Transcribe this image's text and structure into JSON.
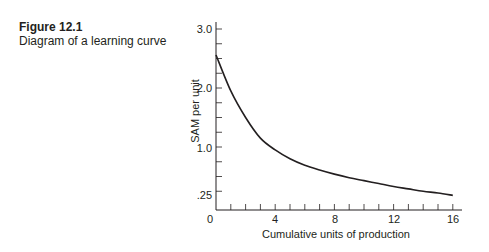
{
  "caption": {
    "figure_number": "Figure 12.1",
    "title": "Diagram of a learning curve"
  },
  "chart_data": {
    "type": "line",
    "title": "Diagram of a learning curve",
    "xlabel": "Cumulative units of production",
    "ylabel": "SAM per unit",
    "x_ticks": [
      "0",
      "4",
      "8",
      "12",
      "16"
    ],
    "y_ticks": [
      ".25",
      "1.0",
      "2.0",
      "3.0"
    ],
    "xlim": [
      0,
      16
    ],
    "ylim": [
      0,
      3.0
    ],
    "grid": false,
    "legend": null,
    "series": [
      {
        "name": "Learning curve",
        "x": [
          0,
          1,
          2,
          3,
          4,
          5,
          6,
          7,
          8,
          9,
          10,
          11,
          12,
          13,
          14,
          15,
          16
        ],
        "values": [
          2.56,
          1.95,
          1.5,
          1.15,
          0.95,
          0.8,
          0.69,
          0.61,
          0.54,
          0.48,
          0.43,
          0.38,
          0.33,
          0.29,
          0.25,
          0.22,
          0.18
        ]
      }
    ]
  }
}
